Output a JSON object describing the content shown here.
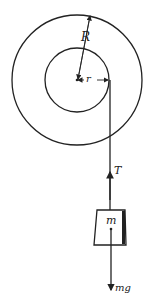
{
  "diagram": {
    "type": "pulley with hanging mass",
    "labels": {
      "outer_radius": "R",
      "inner_radius": "r",
      "tension": "T",
      "mass": "m",
      "weight": "mg"
    },
    "colors": {
      "stroke": "#222222",
      "background": "#ffffff"
    }
  }
}
